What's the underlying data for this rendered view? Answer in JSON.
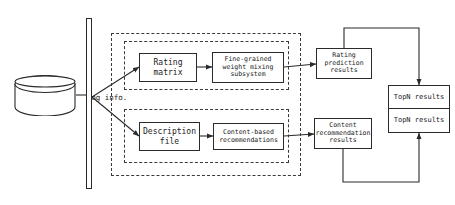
{
  "diagram": {
    "type": "flowchart",
    "background_color": "#ffffff",
    "stroke_color": "#2b2b2b",
    "dashed_stroke_color": "#3a3a3a"
  },
  "datastore": {
    "name": "log-info-cylinder",
    "label": "Log info."
  },
  "pipeline_bar": {
    "name": "pipeline-split-bar",
    "label": ""
  },
  "groups": {
    "outer": {
      "label": ""
    },
    "rating_subsystem": {
      "label": ""
    },
    "content_subsystem": {
      "label": ""
    }
  },
  "nodes": {
    "rating_matrix": {
      "label": "Rating\nmatrix"
    },
    "weight_mixing": {
      "label": "Fine-grained\nweight mixing\nsubsystem"
    },
    "description_file": {
      "label": "Description\nfile"
    },
    "content_based": {
      "label": "Content-based\nrecommendations"
    },
    "rating_prediction": {
      "label": "Rating\nprediction\nresults"
    },
    "content_results": {
      "label": "Content\nrecommendation\nresults"
    },
    "topn_upper": {
      "label": "TopN results"
    },
    "topn_lower": {
      "label": "TopN results"
    }
  },
  "edges": [
    {
      "from": "log-info-cylinder",
      "to": "pipeline-split-bar",
      "style": "solid"
    },
    {
      "from": "pipeline-split-bar",
      "to": "rating-matrix",
      "style": "solid-arrow"
    },
    {
      "from": "pipeline-split-bar",
      "to": "description-file",
      "style": "solid-arrow"
    },
    {
      "from": "rating-matrix",
      "to": "weight-mixing",
      "style": "solid-arrow"
    },
    {
      "from": "weight-mixing",
      "to": "rating-prediction",
      "style": "solid-arrow"
    },
    {
      "from": "description-file",
      "to": "content-based",
      "style": "solid-arrow"
    },
    {
      "from": "content-based",
      "to": "content-results",
      "style": "solid-arrow"
    },
    {
      "from": "rating-prediction",
      "to": "topn-upper",
      "style": "elbow-arrow"
    },
    {
      "from": "content-results",
      "to": "topn-lower",
      "style": "elbow-arrow"
    }
  ]
}
